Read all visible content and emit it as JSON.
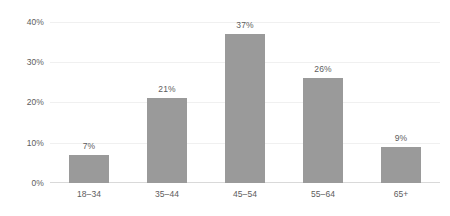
{
  "chart_data": {
    "type": "bar",
    "title": "",
    "subtitle": "",
    "xlabel": "",
    "ylabel": "",
    "categories": [
      "18–34",
      "35–44",
      "45–54",
      "55–64",
      "65+"
    ],
    "values": [
      7,
      21,
      37,
      26,
      9
    ],
    "data_labels": [
      "7%",
      "21%",
      "37%",
      "26%",
      "9%"
    ],
    "ylim": [
      0,
      40
    ],
    "ytick_values": [
      0,
      10,
      20,
      30,
      40
    ],
    "ytick_labels": [
      "0%",
      "10%",
      "20%",
      "30%",
      "40%"
    ],
    "grid": "horizontal",
    "legend": "none",
    "series": [
      {
        "name": "",
        "values": [
          7,
          21,
          37,
          26,
          9
        ]
      }
    ],
    "colors": {
      "bar_fill": "#9a9a9a",
      "gridline": "#f0f0f0",
      "axis_line": "#d9d9d9",
      "text": "#5d5d5d",
      "background": "#ffffff"
    }
  }
}
